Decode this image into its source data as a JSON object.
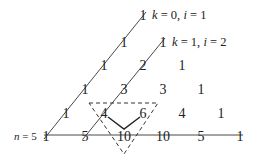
{
  "diagram": {
    "labels": {
      "k0": {
        "k": "k",
        "k_eq": " = 0, ",
        "i": "i",
        "i_eq": " = 1"
      },
      "k1": {
        "k": "k",
        "k_eq": " = 1, ",
        "i": "i",
        "i_eq": " = 2"
      },
      "n5": {
        "n": "n",
        "n_eq": " = 5"
      }
    },
    "rows": [
      [
        "1"
      ],
      [
        "1",
        "1"
      ],
      [
        "1",
        "2",
        "1"
      ],
      [
        "1",
        "3",
        "3",
        "1"
      ],
      [
        "1",
        "4",
        "6",
        "4",
        "1"
      ],
      [
        "1",
        "5",
        "10",
        "10",
        "5",
        "1"
      ]
    ],
    "highlight": {
      "parents": [
        "4",
        "6"
      ],
      "child": "10"
    },
    "colors": {
      "ink": "#222222",
      "background": "#ffffff"
    }
  }
}
